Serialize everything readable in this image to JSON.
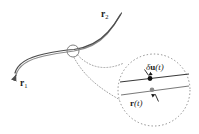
{
  "figure": {
    "type": "diagram",
    "caption_labels": {
      "endpoint_start": "r",
      "endpoint_start_sub": "1",
      "endpoint_end": "r",
      "endpoint_end_sub": "2",
      "variation_delta": "δ",
      "variation_vector": "u",
      "variation_arg": "(t)",
      "path_vector": "r",
      "path_arg": "(t)"
    },
    "colors": {
      "path_dark": "#4d4d4d",
      "path_light": "#8c8c8c",
      "magnifier_outline": "#808080",
      "connector": "#999999",
      "dot_varied": "#111111",
      "dot_actual": "#8a8a8a",
      "text": "#1a1a1a",
      "background": "#ffffff",
      "line_upper": "#3a3a3a",
      "line_lower": "#7a7a7a"
    },
    "geometry": {
      "canvas_width": 199,
      "canvas_height": 134,
      "magnifier_center_x": 154,
      "magnifier_center_y": 90,
      "magnifier_radius": 36,
      "marker_circle_x": 73,
      "marker_circle_y": 51,
      "marker_circle_radius": 6,
      "dot_varied_x": 150,
      "dot_varied_y": 78,
      "dot_actual_x": 152,
      "dot_actual_y": 90
    },
    "elements": {
      "main_path_name": "trajectory-curve",
      "magnifier_name": "magnifier-circle",
      "marker_name": "zoom-marker-circle",
      "connector_name": "callout-connector"
    }
  }
}
